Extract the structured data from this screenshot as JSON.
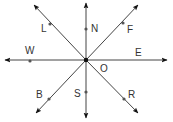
{
  "diagram": {
    "center_label": "O",
    "directions": [
      {
        "label": "N",
        "angle": 90
      },
      {
        "label": "F",
        "angle": 45
      },
      {
        "label": "E",
        "angle": 0
      },
      {
        "label": "R",
        "angle": -45
      },
      {
        "label": "S",
        "angle": -90
      },
      {
        "label": "B",
        "angle": -135
      },
      {
        "label": "W",
        "angle": 180
      },
      {
        "label": "L",
        "angle": 135
      }
    ]
  }
}
